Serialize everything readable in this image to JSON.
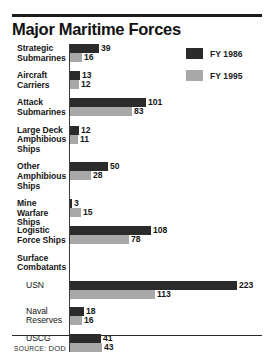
{
  "header": {
    "title": "Major Maritime Forces"
  },
  "legend": {
    "position": "top-right",
    "items": [
      {
        "label": "FY 1986",
        "color": "#2b2b2b",
        "name": "fy-1986"
      },
      {
        "label": "FY 1995",
        "color": "#a8a8a8",
        "name": "fy-1995"
      }
    ]
  },
  "footer": {
    "source_prefix": "Source",
    "source_sep": ":",
    "source_value": "DOD",
    "source_full": "Source: DOD"
  },
  "colors": {
    "series_1": "#2b2b2b",
    "series_2": "#a8a8a8",
    "rule": "#1b1b1b",
    "text": "#151515",
    "background": "#ffffff"
  },
  "chart_data": {
    "type": "bar",
    "orientation": "horizontal",
    "title": "Major Maritime Forces",
    "subtitle": "",
    "xlabel": "",
    "ylabel": "",
    "grid": false,
    "xlim": [
      0,
      230
    ],
    "px_per_unit": 0.75,
    "legend_position": "top-right",
    "source": "Source: DOD",
    "series": [
      {
        "name": "FY 1986",
        "color": "#2b2b2b",
        "values": [
          39,
          13,
          101,
          12,
          50,
          3,
          108,
          null,
          223,
          18,
          41
        ]
      },
      {
        "name": "FY 1995",
        "color": "#a8a8a8",
        "values": [
          16,
          12,
          83,
          11,
          28,
          15,
          78,
          null,
          113,
          16,
          43
        ]
      }
    ],
    "categories": [
      "Strategic Submarines",
      "Aircraft Carriers",
      "Attack Submarines",
      "Large Deck Amphibious Ships",
      "Other Amphibious Ships",
      "Mine Warfare Ships",
      "Logistic Force Ships",
      "Surface Combatants",
      "USN",
      "Naval Reserves",
      "USCG"
    ],
    "groups": [
      {
        "name": "strategic-submarines",
        "label_lines": [
          "Strategic",
          "Submarines"
        ],
        "sub": false,
        "header_only": false,
        "bars": [
          {
            "series": "FY 1986",
            "value": 39,
            "label": "39"
          },
          {
            "series": "FY 1995",
            "value": 16,
            "label": "16"
          }
        ]
      },
      {
        "name": "aircraft-carriers",
        "label_lines": [
          "Aircraft",
          "Carriers"
        ],
        "sub": false,
        "header_only": false,
        "bars": [
          {
            "series": "FY 1986",
            "value": 13,
            "label": "13"
          },
          {
            "series": "FY 1995",
            "value": 12,
            "label": "12"
          }
        ]
      },
      {
        "name": "attack-submarines",
        "label_lines": [
          "Attack",
          "Submarines"
        ],
        "sub": false,
        "header_only": false,
        "bars": [
          {
            "series": "FY 1986",
            "value": 101,
            "label": "101"
          },
          {
            "series": "FY 1995",
            "value": 83,
            "label": "83"
          }
        ]
      },
      {
        "name": "large-deck-amphibious-ships",
        "label_lines": [
          "Large Deck",
          "Amphibious",
          "Ships"
        ],
        "sub": false,
        "header_only": false,
        "bars": [
          {
            "series": "FY 1986",
            "value": 12,
            "label": "12"
          },
          {
            "series": "FY 1995",
            "value": 11,
            "label": "11"
          }
        ]
      },
      {
        "name": "other-amphibious-ships",
        "label_lines": [
          "Other",
          "Amphibious",
          "Ships"
        ],
        "sub": false,
        "header_only": false,
        "bars": [
          {
            "series": "FY 1986",
            "value": 50,
            "label": "50"
          },
          {
            "series": "FY 1995",
            "value": 28,
            "label": "28"
          }
        ]
      },
      {
        "name": "mine-warfare-ships",
        "label_lines": [
          "Mine Warfare",
          "Ships"
        ],
        "sub": false,
        "header_only": false,
        "bars": [
          {
            "series": "FY 1986",
            "value": 3,
            "label": "3"
          },
          {
            "series": "FY 1995",
            "value": 15,
            "label": "15"
          }
        ]
      },
      {
        "name": "logistic-force-ships",
        "label_lines": [
          "Logistic",
          "Force Ships"
        ],
        "sub": false,
        "header_only": false,
        "bars": [
          {
            "series": "FY 1986",
            "value": 108,
            "label": "108"
          },
          {
            "series": "FY 1995",
            "value": 78,
            "label": "78"
          }
        ]
      },
      {
        "name": "surface-combatants",
        "label_lines": [
          "Surface",
          "Combatants"
        ],
        "sub": false,
        "header_only": true,
        "bars": []
      },
      {
        "name": "usn",
        "label_lines": [
          "USN"
        ],
        "sub": true,
        "header_only": false,
        "bars": [
          {
            "series": "FY 1986",
            "value": 223,
            "label": "223"
          },
          {
            "series": "FY 1995",
            "value": 113,
            "label": "113"
          }
        ]
      },
      {
        "name": "naval-reserves",
        "label_lines": [
          "Naval",
          "Reserves"
        ],
        "sub": true,
        "header_only": false,
        "bars": [
          {
            "series": "FY 1986",
            "value": 18,
            "label": "18"
          },
          {
            "series": "FY 1995",
            "value": 16,
            "label": "16"
          }
        ]
      },
      {
        "name": "uscg",
        "label_lines": [
          "USCG"
        ],
        "sub": true,
        "header_only": false,
        "bars": [
          {
            "series": "FY 1986",
            "value": 41,
            "label": "41"
          },
          {
            "series": "FY 1995",
            "value": 43,
            "label": "43"
          }
        ]
      }
    ]
  }
}
